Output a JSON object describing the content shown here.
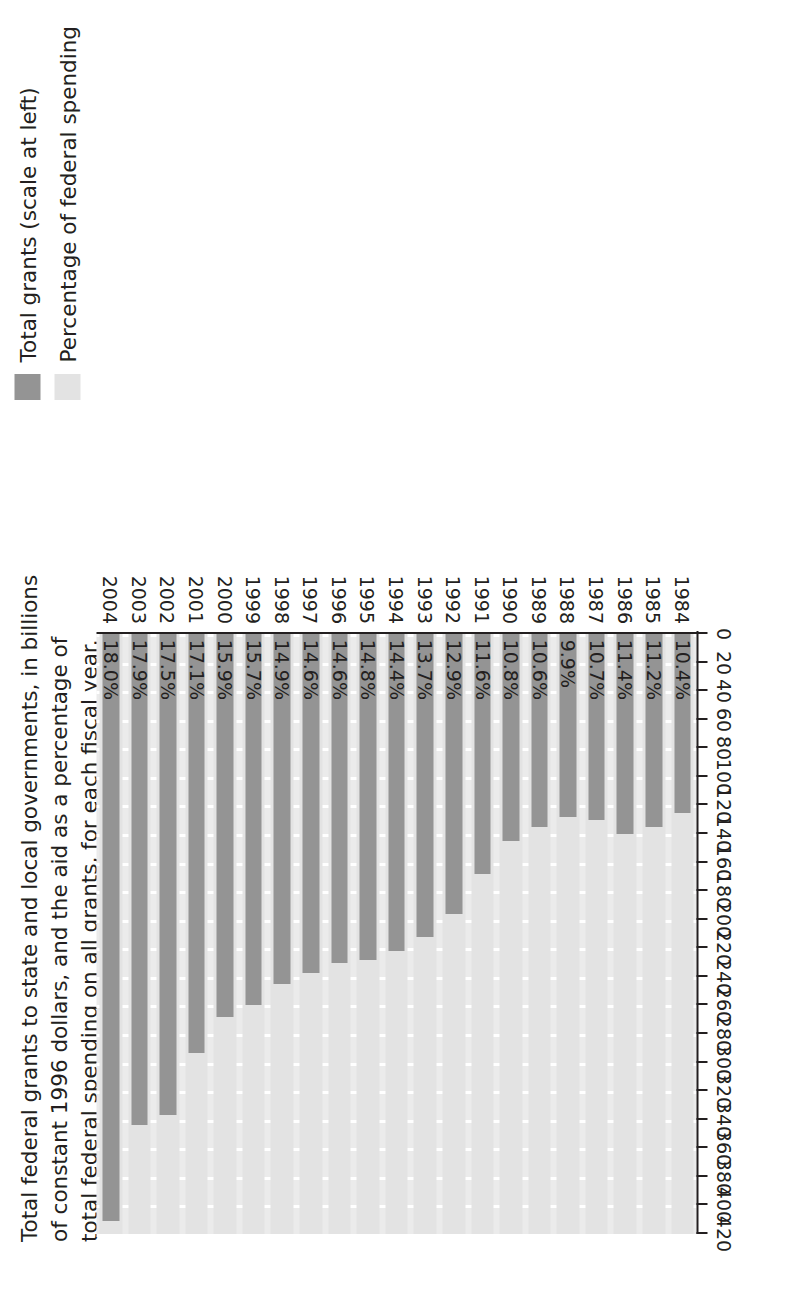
{
  "title": {
    "lines": [
      "Total federal grants to state and local governments, in billions",
      "of constant 1996 dollars, and the aid as a percentage of",
      "total federal spending on all grants, for each fiscal year."
    ]
  },
  "legend": {
    "position": "top-right",
    "items": [
      {
        "label": "Total grants (scale at left)",
        "color": "#949494",
        "swatch_name": "legend-swatch-total-grants"
      },
      {
        "label": "Percentage of federal spending",
        "color": "#e3e3e3",
        "swatch_name": "legend-swatch-percentage"
      }
    ]
  },
  "axis": {
    "x_ticks": [
      "420",
      "400",
      "380",
      "360",
      "340",
      "320",
      "300",
      "280",
      "260",
      "240",
      "220",
      "200",
      "180",
      "160",
      "140",
      "120",
      "100",
      "80",
      "60",
      "40",
      "20",
      "0"
    ],
    "x_min": 0,
    "x_max": 420
  },
  "colors": {
    "bar": "#949494",
    "band": "#e3e3e3",
    "plot_background": "#ebebeb",
    "gridline": "#ffffff",
    "axis": "#231f20",
    "text": "#231f20"
  },
  "chart_data": {
    "type": "bar",
    "title": "Total federal grants to state and local governments, in billions of constant 1996 dollars, and the aid as a percentage of total federal spending on all grants, for each fiscal year.",
    "xlabel": "",
    "ylabel": "Billions of constant 1996 dollars",
    "xlim": [
      0,
      420
    ],
    "grid": true,
    "legend_position": "top-right",
    "orientation": "horizontal-rotated",
    "categories": [
      "1984",
      "1985",
      "1986",
      "1987",
      "1988",
      "1989",
      "1990",
      "1991",
      "1992",
      "1993",
      "1994",
      "1995",
      "1996",
      "1997",
      "1998",
      "1999",
      "2000",
      "2001",
      "2002",
      "2003",
      "2004"
    ],
    "series": [
      {
        "name": "Total grants (scale at left)",
        "unit": "billions of constant 1996 dollars",
        "color": "#949494",
        "values": [
          125,
          135,
          140,
          130,
          128,
          135,
          145,
          168,
          196,
          212,
          222,
          228,
          230,
          237,
          245,
          260,
          268,
          293,
          337,
          344,
          411
        ]
      },
      {
        "name": "Percentage of federal spending",
        "unit": "percent",
        "color": "#e3e3e3",
        "values": [
          10.4,
          11.2,
          11.4,
          10.7,
          9.9,
          10.6,
          10.8,
          11.6,
          12.9,
          13.7,
          14.4,
          14.8,
          14.6,
          14.6,
          14.9,
          15.7,
          15.9,
          17.1,
          17.5,
          17.9,
          18.0
        ],
        "labels": [
          "10.4%",
          "11.2%",
          "11.4%",
          "10.7%",
          "9.9%",
          "10.6%",
          "10.8%",
          "11.6%",
          "12.9%",
          "13.7%",
          "14.4%",
          "14.8%",
          "14.6%",
          "14.6%",
          "14.9%",
          "15.7%",
          "15.9%",
          "17.1%",
          "17.5%",
          "17.9%",
          "18.0%"
        ]
      }
    ]
  }
}
